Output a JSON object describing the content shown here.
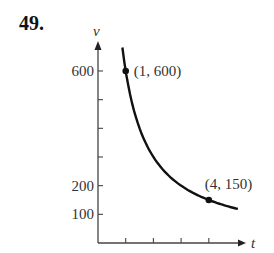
{
  "problem_number": "49.",
  "chart_data": {
    "type": "line",
    "title": "",
    "xlabel": "t",
    "ylabel": "v",
    "function": "v = 600/t",
    "x_range": [
      0.88,
      5.05
    ],
    "y_ticks": [
      100,
      200,
      300,
      400,
      500,
      600
    ],
    "y_tick_labels": [
      "100",
      "200",
      "",
      "",
      "",
      "600"
    ],
    "x_ticks": [
      1,
      2,
      3,
      4
    ],
    "x_tick_labels": [
      "",
      "",
      "",
      ""
    ],
    "series": [
      {
        "name": "v(t)",
        "x": [
          0.88,
          1,
          1.5,
          2,
          2.5,
          3,
          3.5,
          4,
          4.5,
          5.05
        ],
        "y": [
          682,
          600,
          400,
          300,
          240,
          200,
          171,
          150,
          133,
          119
        ]
      }
    ],
    "annotations": [
      {
        "point": [
          1,
          600
        ],
        "label": "(1, 600)"
      },
      {
        "point": [
          4,
          150
        ],
        "label": "(4, 150)"
      }
    ],
    "grid": false,
    "legend": "none",
    "ylim": [
      0,
      700
    ],
    "xlim": [
      0,
      5.3
    ]
  }
}
